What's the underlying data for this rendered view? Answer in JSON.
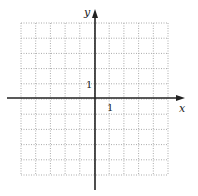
{
  "diagram": {
    "type": "coordinate-grid",
    "axes": {
      "x_label": "x",
      "y_label": "y",
      "x_unit_label": "1",
      "y_unit_label": "1"
    },
    "grid": {
      "columns": 10,
      "rows": 10,
      "x_range": [
        -5,
        5
      ],
      "y_range": [
        -5,
        5
      ],
      "line_style": "dotted"
    },
    "colors": {
      "axis": "#222222",
      "grid": "#aaaaaa",
      "background": "#ffffff"
    }
  }
}
